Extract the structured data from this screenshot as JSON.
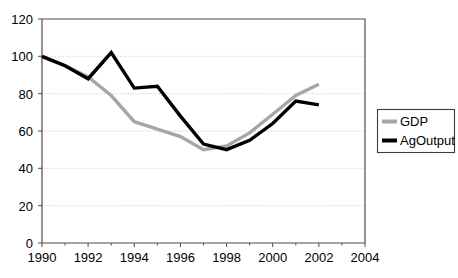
{
  "chart_data": {
    "type": "line",
    "title": "",
    "subtitle": "",
    "xlabel": "",
    "ylabel": "",
    "xlim": [
      1990,
      2004
    ],
    "ylim": [
      0,
      120
    ],
    "grid": true,
    "legend_position": "right",
    "x": [
      1990,
      1991,
      1992,
      1993,
      1994,
      1995,
      1996,
      1997,
      1998,
      1999,
      2000,
      2001,
      2002
    ],
    "xtick_labels": [
      "1990",
      "1992",
      "1994",
      "1996",
      "1998",
      "2000",
      "2002",
      "2004"
    ],
    "xticks": [
      1990,
      1992,
      1994,
      1996,
      1998,
      2000,
      2002,
      2004
    ],
    "ytick_labels": [
      "0",
      "20",
      "40",
      "60",
      "80",
      "100",
      "120"
    ],
    "yticks": [
      0,
      20,
      40,
      60,
      80,
      100,
      120
    ],
    "series": [
      {
        "name": "GDP",
        "color": "#a6a6a6",
        "values": [
          100,
          95,
          89,
          79,
          65,
          61,
          57,
          50,
          52,
          59,
          69,
          79,
          85
        ]
      },
      {
        "name": "AgOutput",
        "color": "#000000",
        "values": [
          100,
          95,
          88,
          102,
          83,
          84,
          68,
          53,
          50,
          55,
          64,
          76,
          74
        ]
      }
    ]
  },
  "legend": {
    "entries": [
      {
        "label": "GDP",
        "color": "#a6a6a6"
      },
      {
        "label": "AgOutput",
        "color": "#000000"
      }
    ]
  },
  "axes": {
    "y_ticks": [
      "120",
      "100",
      "80",
      "60",
      "40",
      "20",
      "0"
    ],
    "x_ticks": [
      "1990",
      "1992",
      "1994",
      "1996",
      "1998",
      "2000",
      "2002",
      "2004"
    ]
  }
}
